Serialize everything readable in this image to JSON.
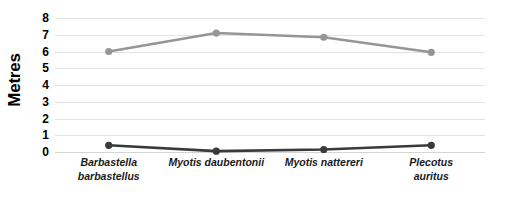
{
  "chart_data": {
    "type": "line",
    "title": "",
    "xlabel": "",
    "ylabel": "Metres",
    "ylim": [
      0,
      8
    ],
    "yticks": [
      8,
      7,
      6,
      5,
      4,
      3,
      2,
      1,
      0
    ],
    "grid": true,
    "legend": "none",
    "categories": [
      "Barbastella barbastellus",
      "Myotis daubentonii",
      "Myotis nattereri",
      "Plecotus auritus"
    ],
    "category_lines": [
      [
        "Barbastella",
        "barbastellus"
      ],
      [
        "Myotis daubentonii"
      ],
      [
        "Myotis nattereri"
      ],
      [
        "Plecotus auritus"
      ]
    ],
    "series": [
      {
        "name": "series-grey",
        "color": "#969696",
        "values": [
          6.0,
          7.1,
          6.85,
          5.95
        ]
      },
      {
        "name": "series-dark",
        "color": "#3a3a3a",
        "values": [
          0.4,
          0.05,
          0.15,
          0.4
        ]
      }
    ],
    "colors": {
      "gridline": "#e2e2e2",
      "baseline": "#d4d4d4",
      "text": "#000000",
      "background": "#ffffff"
    }
  }
}
